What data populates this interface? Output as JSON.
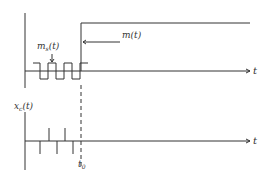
{
  "diagram": {
    "top_panel": {
      "signal_label": "m(t)",
      "sampled_label_base": "m",
      "sampled_label_sub": "s",
      "sampled_label_arg": "(t)",
      "axis_label": "t"
    },
    "bottom_panel": {
      "signal_label_base": "x",
      "signal_label_sub": "c",
      "signal_label_arg": "(t)",
      "axis_label": "t",
      "marker_label_base": "t",
      "marker_label_sub": "0"
    },
    "colors": {
      "ink": "#333333"
    }
  }
}
